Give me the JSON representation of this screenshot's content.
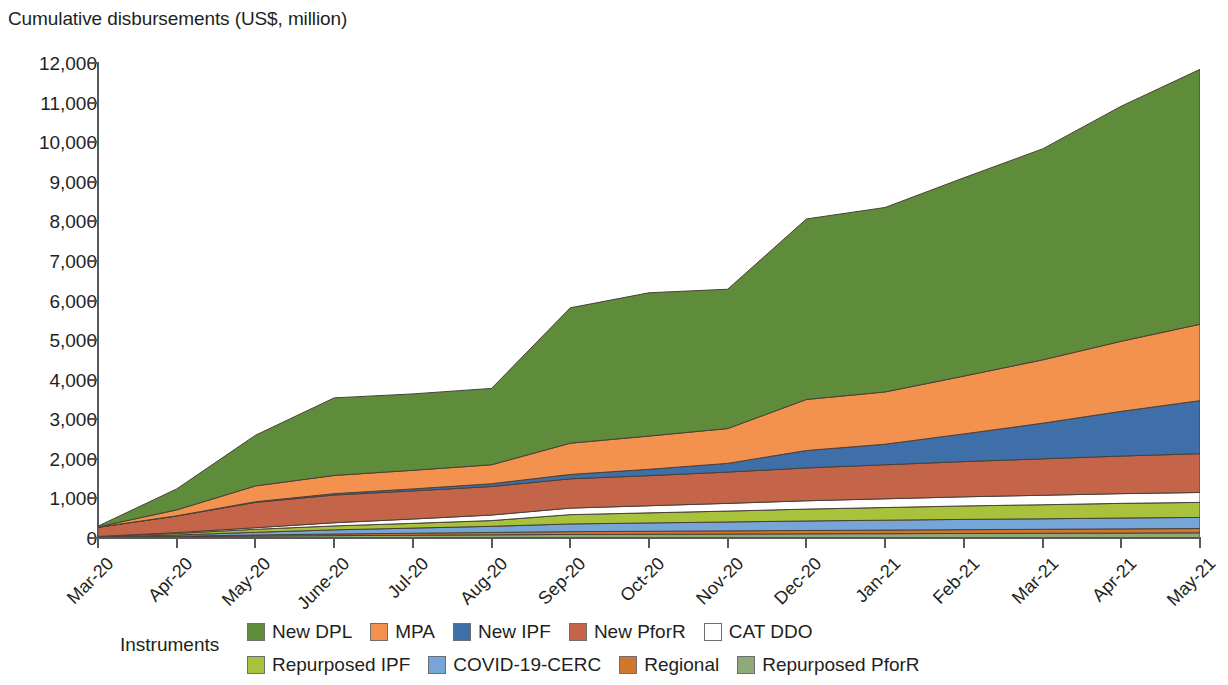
{
  "chart_data": {
    "type": "area",
    "stacked": true,
    "title": "Cumulative disbursements (US$, million)",
    "xlabel": "",
    "ylabel": "Cumulative disbursements (US$, million)",
    "ylim": [
      0,
      12000
    ],
    "ytick_step": 1000,
    "grid": false,
    "legend_position": "bottom",
    "legend_title": "Instruments",
    "ytick_labels": [
      "12,000",
      "11,000",
      "10,000",
      "9,000",
      "8,000",
      "7,000",
      "6,000",
      "5,000",
      "4,000",
      "3,000",
      "2,000",
      "1,000",
      "0"
    ],
    "categories": [
      "Mar-20",
      "Apr-20",
      "May-20",
      "June-20",
      "Jul-20",
      "Aug-20",
      "Sep-20",
      "Oct-20",
      "Nov-20",
      "Dec-20",
      "Jan-21",
      "Feb-21",
      "Mar-21",
      "Apr-21",
      "May-21"
    ],
    "series": [
      {
        "name": "Repurposed PforR",
        "color": "#8FA977",
        "values": [
          20,
          35,
          50,
          60,
          70,
          80,
          90,
          95,
          100,
          105,
          110,
          115,
          120,
          125,
          130
        ]
      },
      {
        "name": "Regional",
        "color": "#D2762C",
        "values": [
          0,
          10,
          25,
          40,
          50,
          60,
          70,
          75,
          80,
          85,
          90,
          95,
          100,
          105,
          110
        ]
      },
      {
        "name": "COVID-19-CERC",
        "color": "#76A5D8",
        "values": [
          5,
          30,
          70,
          105,
          130,
          155,
          195,
          210,
          225,
          240,
          250,
          260,
          265,
          275,
          280
        ]
      },
      {
        "name": "Repurposed IPF",
        "color": "#A8C23C",
        "values": [
          10,
          40,
          75,
          100,
          120,
          145,
          235,
          255,
          275,
          300,
          320,
          340,
          355,
          370,
          380
        ]
      },
      {
        "name": "CAT DDO",
        "color": "#FFFFFF",
        "values": [
          5,
          20,
          40,
          80,
          110,
          140,
          165,
          180,
          195,
          210,
          220,
          230,
          240,
          245,
          250
        ]
      },
      {
        "name": "New PforR",
        "color": "#C4654A",
        "values": [
          230,
          420,
          640,
          700,
          710,
          720,
          740,
          760,
          790,
          830,
          860,
          890,
          920,
          950,
          980
        ]
      },
      {
        "name": "New IPF",
        "color": "#3E6FA8",
        "values": [
          0,
          5,
          15,
          35,
          50,
          70,
          110,
          160,
          220,
          440,
          520,
          700,
          900,
          1130,
          1340
        ]
      },
      {
        "name": "MPA",
        "color": "#F3914F",
        "values": [
          10,
          150,
          400,
          460,
          470,
          480,
          790,
          840,
          880,
          1290,
          1320,
          1460,
          1600,
          1770,
          1930
        ]
      },
      {
        "name": "New DPL",
        "color": "#5E8C3A",
        "values": [
          20,
          530,
          1280,
          1960,
          1930,
          1930,
          3420,
          3620,
          3520,
          4560,
          4660,
          5010,
          5330,
          5940,
          6440
        ]
      }
    ]
  },
  "legend": {
    "title": "Instruments",
    "rows": [
      [
        {
          "label": "New DPL",
          "color": "#5E8C3A"
        },
        {
          "label": "MPA",
          "color": "#F3914F"
        },
        {
          "label": "New IPF",
          "color": "#3E6FA8"
        },
        {
          "label": "New PforR",
          "color": "#C4654A"
        },
        {
          "label": "CAT DDO",
          "color": "#FFFFFF"
        }
      ],
      [
        {
          "label": "Repurposed IPF",
          "color": "#A8C23C"
        },
        {
          "label": "COVID-19-CERC",
          "color": "#76A5D8"
        },
        {
          "label": "Regional",
          "color": "#D2762C"
        },
        {
          "label": "Repurposed PforR",
          "color": "#8FA977"
        }
      ]
    ]
  }
}
